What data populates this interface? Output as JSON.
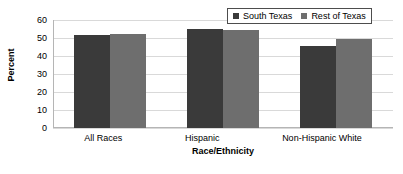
{
  "chart_data": {
    "type": "bar",
    "title": "",
    "xlabel": "Race/Ethnicity",
    "ylabel": "Percent",
    "categories": [
      "All Races",
      "Hispanic",
      "Non-Hispanic White"
    ],
    "series": [
      {
        "name": "South Texas",
        "color": "#3a3a3a",
        "values": [
          51.4,
          54.8,
          45.5
        ]
      },
      {
        "name": "Rest of Texas",
        "color": "#6e6e6e",
        "values": [
          52.0,
          54.3,
          49.3
        ]
      }
    ],
    "ylim": [
      0,
      60
    ],
    "ytick_step": 10,
    "yticks": [
      "60",
      "50",
      "40",
      "30",
      "20",
      "10",
      "0"
    ],
    "grid": true,
    "legend_position": "top-right"
  },
  "legend": {
    "items": [
      {
        "label": "South Texas",
        "swatch_icon": "legend-swatch-dark"
      },
      {
        "label": "Rest of Texas",
        "swatch_icon": "legend-swatch-light"
      }
    ]
  }
}
